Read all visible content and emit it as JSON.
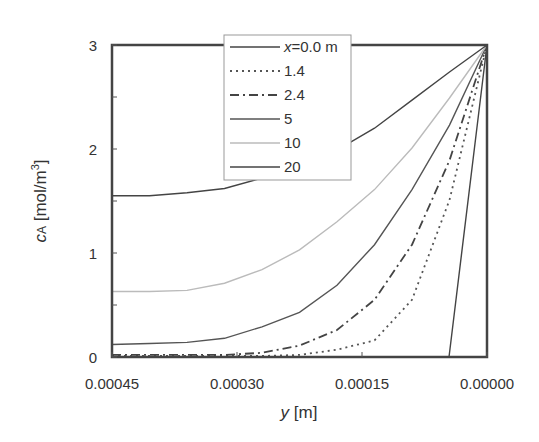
{
  "chart_data": {
    "type": "line",
    "title": "",
    "xlabel": "y [m]",
    "ylabel": "cA [mol/m3]",
    "xlim": [
      0.00045,
      0.0
    ],
    "ylim": [
      0,
      3
    ],
    "x_reversed": true,
    "xticks": [
      "0.00045",
      "0.00030",
      "0.00015",
      "0.00000"
    ],
    "yticks": [
      "0",
      "1",
      "2",
      "3"
    ],
    "grid": false,
    "legend_position": "upper center",
    "x": [
      0.00045,
      0.000405,
      0.00036,
      0.000315,
      0.00027,
      0.000225,
      0.00018,
      0.000135,
      9e-05,
      4.5e-05,
      0.0
    ],
    "series": [
      {
        "name": "x=0.0 m",
        "style": "solid",
        "color": "#444444",
        "x": [
          0.00045,
          4.56e-05,
          0.0
        ],
        "values": [
          0.0,
          0.0,
          3.0
        ]
      },
      {
        "name": "1.4",
        "style": "dotted",
        "color": "#555555",
        "values": [
          0.01,
          0.01,
          0.01,
          0.01,
          0.01,
          0.02,
          0.07,
          0.16,
          0.55,
          1.51,
          3.0
        ]
      },
      {
        "name": "2.4",
        "style": "dashdot",
        "color": "#444444",
        "values": [
          0.02,
          0.02,
          0.02,
          0.02,
          0.04,
          0.11,
          0.26,
          0.55,
          1.08,
          1.89,
          3.0
        ]
      },
      {
        "name": "5",
        "style": "solid",
        "color": "#555555",
        "values": [
          0.12,
          0.13,
          0.14,
          0.18,
          0.29,
          0.43,
          0.69,
          1.08,
          1.61,
          2.23,
          3.0
        ]
      },
      {
        "name": "10",
        "style": "solid",
        "color": "#bbbbbb",
        "values": [
          0.63,
          0.63,
          0.64,
          0.71,
          0.84,
          1.03,
          1.3,
          1.61,
          2.01,
          2.49,
          3.0
        ]
      },
      {
        "name": "20",
        "style": "solid",
        "color": "#444444",
        "values": [
          1.55,
          1.55,
          1.58,
          1.62,
          1.72,
          1.85,
          1.99,
          2.2,
          2.47,
          2.74,
          3.0
        ]
      }
    ]
  },
  "axes": {
    "xlabel_var": "y",
    "xlabel_unit": " [m]",
    "ylabel_var": "c",
    "ylabel_sub": "A",
    "ylabel_unit": " [mol/m",
    "ylabel_sup": "3",
    "ylabel_close": "]"
  },
  "legend": {
    "items": [
      "x=0.0 m",
      "1.4",
      "2.4",
      "5",
      "10",
      "20"
    ],
    "first_var": "x",
    "first_rest": "=0.0 m"
  }
}
